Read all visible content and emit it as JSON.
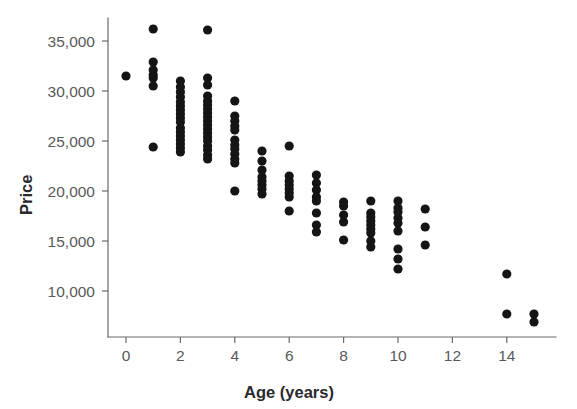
{
  "chart_data": {
    "type": "scatter",
    "title": "",
    "xlabel": "Age (years)",
    "ylabel": "Price",
    "xlim": [
      -0.6,
      16.2
    ],
    "ylim": [
      5800,
      37200
    ],
    "grid": false,
    "legend": null,
    "marker": {
      "shape": "circle",
      "color": "#151515",
      "radius_px": 4.6
    },
    "xticks": [
      0,
      2,
      4,
      6,
      8,
      10,
      12,
      14
    ],
    "xticklabels": [
      "0",
      "2",
      "4",
      "6",
      "8",
      "10",
      "12",
      "14"
    ],
    "yticks": [
      10000,
      15000,
      20000,
      25000,
      30000,
      35000
    ],
    "yticklabels": [
      "10,000",
      "15,000",
      "20,000",
      "25,000",
      "30,000",
      "35,000"
    ],
    "points": [
      {
        "x": 0,
        "y": 31500
      },
      {
        "x": 1,
        "y": 36200
      },
      {
        "x": 1,
        "y": 32900
      },
      {
        "x": 1,
        "y": 32100
      },
      {
        "x": 1,
        "y": 31600
      },
      {
        "x": 1,
        "y": 31300
      },
      {
        "x": 1,
        "y": 30500
      },
      {
        "x": 1,
        "y": 24400
      },
      {
        "x": 2,
        "y": 31000
      },
      {
        "x": 2,
        "y": 30400
      },
      {
        "x": 2,
        "y": 29900
      },
      {
        "x": 2,
        "y": 29400
      },
      {
        "x": 2,
        "y": 28900
      },
      {
        "x": 2,
        "y": 28500
      },
      {
        "x": 2,
        "y": 28100
      },
      {
        "x": 2,
        "y": 27700
      },
      {
        "x": 2,
        "y": 27300
      },
      {
        "x": 2,
        "y": 26900
      },
      {
        "x": 2,
        "y": 26300
      },
      {
        "x": 2,
        "y": 25900
      },
      {
        "x": 2,
        "y": 25500
      },
      {
        "x": 2,
        "y": 25100
      },
      {
        "x": 2,
        "y": 24700
      },
      {
        "x": 2,
        "y": 24300
      },
      {
        "x": 2,
        "y": 23900
      },
      {
        "x": 3,
        "y": 36100
      },
      {
        "x": 3,
        "y": 31300
      },
      {
        "x": 3,
        "y": 30600
      },
      {
        "x": 3,
        "y": 29500
      },
      {
        "x": 3,
        "y": 29000
      },
      {
        "x": 3,
        "y": 28600
      },
      {
        "x": 3,
        "y": 28200
      },
      {
        "x": 3,
        "y": 27800
      },
      {
        "x": 3,
        "y": 27400
      },
      {
        "x": 3,
        "y": 27000
      },
      {
        "x": 3,
        "y": 26600
      },
      {
        "x": 3,
        "y": 26200
      },
      {
        "x": 3,
        "y": 25800
      },
      {
        "x": 3,
        "y": 25400
      },
      {
        "x": 3,
        "y": 25000
      },
      {
        "x": 3,
        "y": 24500
      },
      {
        "x": 3,
        "y": 24100
      },
      {
        "x": 3,
        "y": 23600
      },
      {
        "x": 3,
        "y": 23200
      },
      {
        "x": 4,
        "y": 29000
      },
      {
        "x": 4,
        "y": 27500
      },
      {
        "x": 4,
        "y": 27000
      },
      {
        "x": 4,
        "y": 26500
      },
      {
        "x": 4,
        "y": 26100
      },
      {
        "x": 4,
        "y": 25100
      },
      {
        "x": 4,
        "y": 24600
      },
      {
        "x": 4,
        "y": 24200
      },
      {
        "x": 4,
        "y": 23700
      },
      {
        "x": 4,
        "y": 23200
      },
      {
        "x": 4,
        "y": 22800
      },
      {
        "x": 4,
        "y": 20000
      },
      {
        "x": 5,
        "y": 24000
      },
      {
        "x": 5,
        "y": 23000
      },
      {
        "x": 5,
        "y": 22100
      },
      {
        "x": 5,
        "y": 21400
      },
      {
        "x": 5,
        "y": 21000
      },
      {
        "x": 5,
        "y": 20600
      },
      {
        "x": 5,
        "y": 20200
      },
      {
        "x": 5,
        "y": 19700
      },
      {
        "x": 6,
        "y": 24500
      },
      {
        "x": 6,
        "y": 21500
      },
      {
        "x": 6,
        "y": 21000
      },
      {
        "x": 6,
        "y": 20600
      },
      {
        "x": 6,
        "y": 20200
      },
      {
        "x": 6,
        "y": 19800
      },
      {
        "x": 6,
        "y": 19400
      },
      {
        "x": 6,
        "y": 18000
      },
      {
        "x": 7,
        "y": 21600
      },
      {
        "x": 7,
        "y": 20800
      },
      {
        "x": 7,
        "y": 20100
      },
      {
        "x": 7,
        "y": 19400
      },
      {
        "x": 7,
        "y": 19000
      },
      {
        "x": 7,
        "y": 17800
      },
      {
        "x": 7,
        "y": 16600
      },
      {
        "x": 7,
        "y": 15900
      },
      {
        "x": 8,
        "y": 18900
      },
      {
        "x": 8,
        "y": 18500
      },
      {
        "x": 8,
        "y": 17600
      },
      {
        "x": 8,
        "y": 16900
      },
      {
        "x": 8,
        "y": 15100
      },
      {
        "x": 9,
        "y": 19000
      },
      {
        "x": 9,
        "y": 17800
      },
      {
        "x": 9,
        "y": 17400
      },
      {
        "x": 9,
        "y": 17000
      },
      {
        "x": 9,
        "y": 16600
      },
      {
        "x": 9,
        "y": 16200
      },
      {
        "x": 9,
        "y": 15800
      },
      {
        "x": 9,
        "y": 15000
      },
      {
        "x": 9,
        "y": 14400
      },
      {
        "x": 10,
        "y": 19000
      },
      {
        "x": 10,
        "y": 18300
      },
      {
        "x": 10,
        "y": 17900
      },
      {
        "x": 10,
        "y": 17300
      },
      {
        "x": 10,
        "y": 16800
      },
      {
        "x": 10,
        "y": 16000
      },
      {
        "x": 10,
        "y": 14200
      },
      {
        "x": 10,
        "y": 13200
      },
      {
        "x": 10,
        "y": 12200
      },
      {
        "x": 11,
        "y": 18200
      },
      {
        "x": 11,
        "y": 16400
      },
      {
        "x": 11,
        "y": 14600
      },
      {
        "x": 14,
        "y": 11700
      },
      {
        "x": 14,
        "y": 7700
      },
      {
        "x": 15,
        "y": 7700
      },
      {
        "x": 15,
        "y": 6900
      }
    ]
  }
}
